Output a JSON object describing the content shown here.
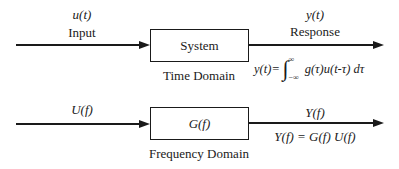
{
  "time_domain": {
    "input_signal": "u(t)",
    "input_label": "Input",
    "system_label": "System",
    "output_signal": "y(t)",
    "output_label": "Response",
    "domain_label": "Time Domain",
    "equation": {
      "lhs": "y(t)",
      "equals": "=",
      "integral_sign": "∫",
      "upper_limit": "∞",
      "lower_limit": "−∞",
      "integrand": "g(τ)u(t-τ)",
      "differential": "dτ"
    }
  },
  "frequency_domain": {
    "input_signal": "U(f)",
    "system_label": "G(f)",
    "output_signal": "Y(f)",
    "equation": "Y(f) = G(f) U(f)",
    "domain_label": "Frequency Domain"
  },
  "colors": {
    "stroke": "#1a1a1a",
    "background": "#ffffff"
  }
}
